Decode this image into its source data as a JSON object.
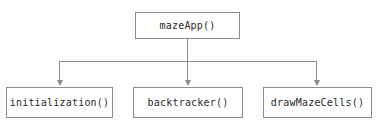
{
  "diagram": {
    "type": "call-hierarchy-tree",
    "orientation": "top-down",
    "title": "",
    "edge_style": "orthogonal-arrow",
    "colors": {
      "background": "#fdfdfd",
      "node_fill": "#ffffff",
      "node_border": "#8c8c8c",
      "connector": "#8c8c8c",
      "text": "#2b2b2b"
    },
    "root": {
      "label": "mazeApp()"
    },
    "children": [
      {
        "label": "initialization()"
      },
      {
        "label": "backtracker()"
      },
      {
        "label": "drawMazeCells()"
      }
    ],
    "edges": [
      {
        "from": "mazeApp()",
        "to": "initialization()",
        "arrow": "down-arrow-icon"
      },
      {
        "from": "mazeApp()",
        "to": "backtracker()",
        "arrow": "down-arrow-icon"
      },
      {
        "from": "mazeApp()",
        "to": "drawMazeCells()",
        "arrow": "down-arrow-icon"
      }
    ]
  }
}
